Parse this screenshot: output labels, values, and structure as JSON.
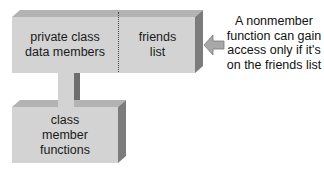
{
  "diagram": {
    "class_box": {
      "private_section_label_line1": "private class",
      "private_section_label_line2": "data members",
      "friends_section_label_line1": "friends",
      "friends_section_label_line2": "list"
    },
    "member_functions_box": {
      "label_line1": "class",
      "label_line2": "member",
      "label_line3": "functions"
    },
    "annotation": {
      "line1": "A nonmember",
      "line2": "function can gain",
      "line3": "access only if it's",
      "line4": "on the friends list"
    },
    "colors": {
      "box_face": "#d3d3d3",
      "box_top": "#b0b0b0",
      "box_side": "#7a7a7a",
      "arrow": "#a8a8a8",
      "text": "#1a1a1a"
    }
  }
}
